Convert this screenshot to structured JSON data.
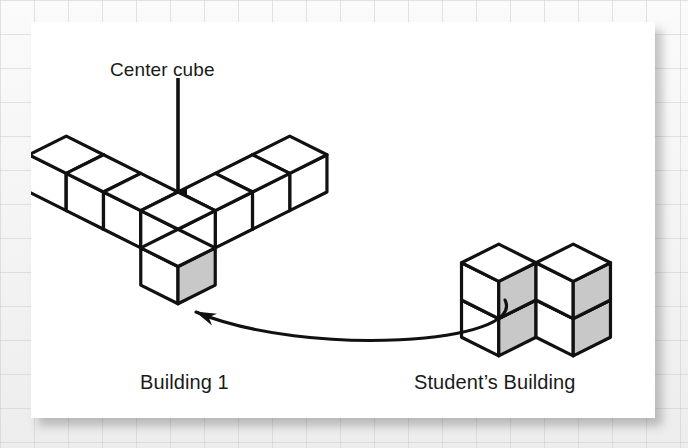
{
  "figure": {
    "type": "isometric-cube-diagram",
    "background_color": "#f2f2f2",
    "panel_color": "#ffffff",
    "stroke_color": "#111111",
    "face_top_color": "#ffffff",
    "face_left_color": "#ffffff",
    "face_right_color": "#c8c8c8",
    "shaded_face_color": "#c8c8c8",
    "labels": {
      "center_cube": "Center cube",
      "building_1": "Building 1",
      "students_building": "Student’s Building"
    },
    "annotations": [
      {
        "name": "center-cube-pointer",
        "kind": "straight-arrow",
        "from": [
          178,
          78
        ],
        "to": [
          178,
          192
        ],
        "points_to": "center cube of Building 1"
      },
      {
        "name": "students-building-pointer",
        "kind": "curved-arrow",
        "from": [
          505,
          300
        ],
        "to": [
          196,
          312
        ],
        "points_to": "near front-bottom cube of Building 1"
      }
    ],
    "buildings": [
      {
        "name": "building-1",
        "label": "Building 1",
        "cube_size": 38,
        "origin": [
          178,
          192
        ],
        "description": "Three-armed corner structure radiating from a center cube",
        "cubes": [
          {
            "gx": 0,
            "gy": 0,
            "gz": 0,
            "shaded": false,
            "role": "center-cube"
          },
          {
            "gx": -1,
            "gy": 0,
            "gz": 0,
            "shaded": true,
            "role": "left-arm"
          },
          {
            "gx": -2,
            "gy": 0,
            "gz": 0,
            "shaded": true,
            "role": "left-arm"
          },
          {
            "gx": -3,
            "gy": 0,
            "gz": 0,
            "shaded": true,
            "role": "left-arm"
          },
          {
            "gx": 0,
            "gy": -1,
            "gz": 0,
            "shaded": false,
            "role": "right-arm"
          },
          {
            "gx": 0,
            "gy": -2,
            "gz": 0,
            "shaded": false,
            "role": "right-arm"
          },
          {
            "gx": 0,
            "gy": -3,
            "gz": 0,
            "shaded": false,
            "role": "right-arm"
          },
          {
            "gx": 1,
            "gy": 1,
            "gz": 0,
            "shaded": true,
            "role": "front-arm"
          }
        ],
        "cube_count": 8
      },
      {
        "name": "students-building",
        "label": "Student’s Building",
        "cube_size": 38,
        "origin": [
          536,
          300
        ],
        "description": "Two side-by-side columns, each two cubes tall",
        "cubes": [
          {
            "gx": -1,
            "gy": 0,
            "gz": 0,
            "shaded": true,
            "role": "left-column-bottom"
          },
          {
            "gx": -1,
            "gy": 0,
            "gz": 1,
            "shaded": true,
            "role": "left-column-top"
          },
          {
            "gx": 0,
            "gy": -1,
            "gz": 0,
            "shaded": true,
            "role": "right-column-bottom"
          },
          {
            "gx": 0,
            "gy": -1,
            "gz": 1,
            "shaded": true,
            "role": "right-column-top"
          }
        ],
        "cube_count": 4
      }
    ]
  }
}
